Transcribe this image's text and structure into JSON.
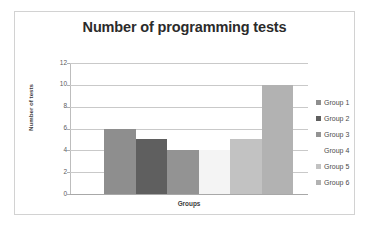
{
  "chart_data": {
    "type": "bar",
    "title": "Number of programming tests",
    "xlabel": "Groups",
    "ylabel": "Number of tests",
    "categories": [
      "Group 1",
      "Group 2",
      "Group 3",
      "Group 4",
      "Group 5",
      "Group 6"
    ],
    "values": [
      6,
      5,
      4,
      4,
      5,
      10
    ],
    "ylim": [
      0,
      12
    ],
    "ytick_step": 2,
    "ytick_labels": [
      "12",
      "10",
      "8",
      "6",
      "4",
      "2",
      "0"
    ],
    "xtick_labels": [],
    "grid": "horizontal",
    "legend_position": "right",
    "bar_gap": "none",
    "series": [
      {
        "name": "Number of tests",
        "values": [
          6,
          5,
          4,
          4,
          5,
          10
        ]
      }
    ],
    "bar_colors": [
      "#8e8e8e",
      "#5f5f5f",
      "#939393",
      "#f4f4f4",
      "#c2c2c2",
      "#b2b2b2"
    ],
    "legend_swatch_colors": [
      "#8e8e8e",
      "#5f5f5f",
      "#939393",
      "#ffffff",
      "#c2c2c2",
      "#b2b2b2"
    ]
  },
  "frame": {
    "border_color": "#d2d2d2",
    "background": "#ffffff"
  },
  "axis": {
    "gridline_color": "#c9c9c9",
    "axis_line_color": "#bdbdbd",
    "tick_label_color": "#5b5b5b"
  },
  "title_color": "#2b2b2b"
}
